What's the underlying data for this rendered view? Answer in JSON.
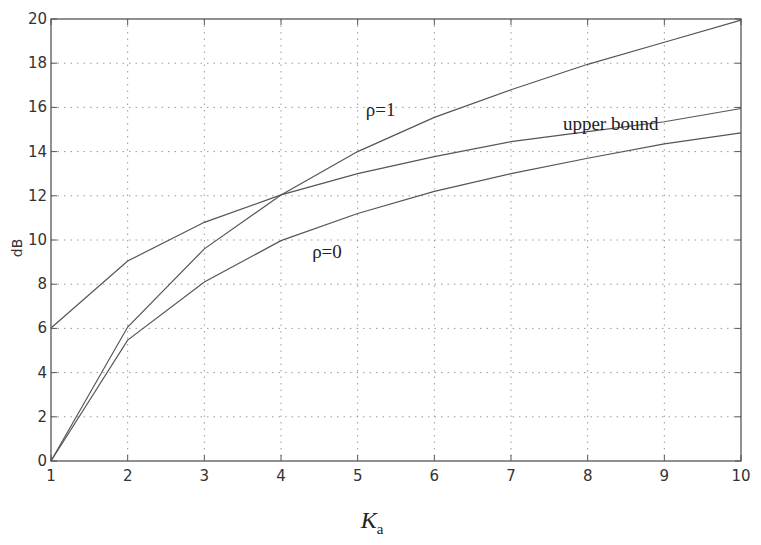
{
  "chart_data": {
    "type": "line",
    "title": "",
    "xlabel": "K",
    "xlabel_subscript": "a",
    "ylabel": "dB",
    "xlim": [
      1,
      10
    ],
    "ylim": [
      0,
      20
    ],
    "grid": true,
    "x": [
      1,
      2,
      3,
      4,
      5,
      6,
      7,
      8,
      9,
      10
    ],
    "xticks": [
      1,
      2,
      3,
      4,
      5,
      6,
      7,
      8,
      9,
      10
    ],
    "yticks": [
      0,
      2,
      4,
      6,
      8,
      10,
      12,
      14,
      16,
      18,
      20
    ],
    "series": [
      {
        "name": "upper bound",
        "values": [
          6.02,
          9.05,
          10.8,
          12.04,
          13.0,
          13.77,
          14.45,
          14.9,
          15.35,
          15.95
        ]
      },
      {
        "name": "ρ=1",
        "values": [
          0,
          6.06,
          9.6,
          12.04,
          14.0,
          15.55,
          16.8,
          17.95,
          18.95,
          19.95
        ]
      },
      {
        "name": "ρ=0",
        "values": [
          0,
          5.47,
          8.1,
          9.97,
          11.2,
          12.2,
          13.0,
          13.7,
          14.35,
          14.85
        ]
      }
    ],
    "annotations": [
      {
        "text": "ρ=1",
        "series": "ρ=1",
        "x": 5.3,
        "y": 15.6
      },
      {
        "text": "upper bound",
        "series": "upper bound",
        "x": 8.3,
        "y": 15.0
      },
      {
        "text": "ρ=0",
        "series": "ρ=0",
        "x": 4.6,
        "y": 9.2
      }
    ]
  }
}
